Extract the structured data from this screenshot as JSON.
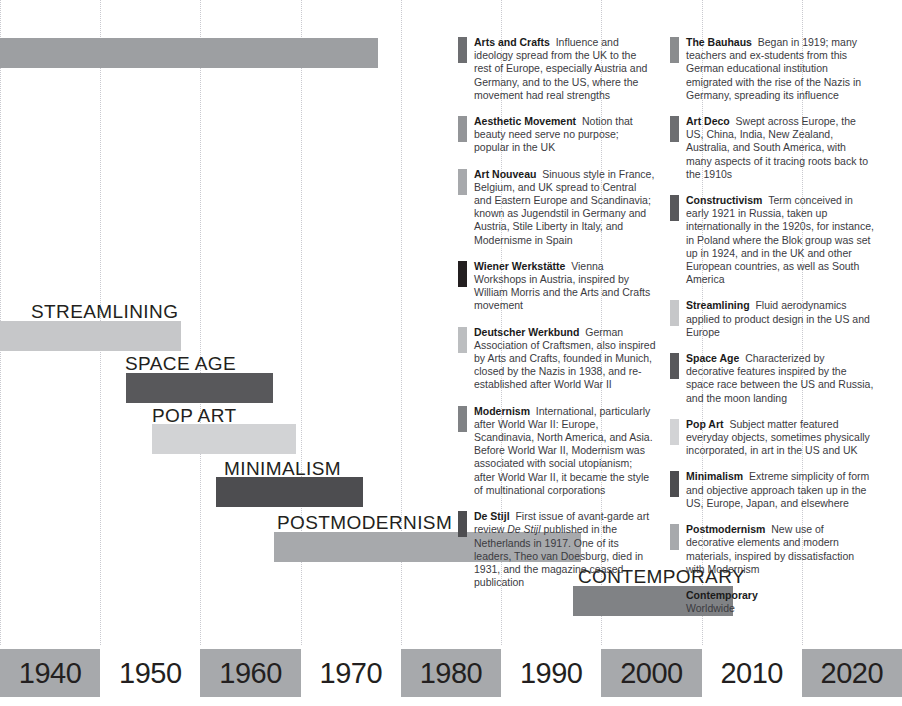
{
  "chart_data": {
    "type": "bar",
    "orientation": "horizontal-timeline",
    "title": "",
    "xlabel": "",
    "ylabel": "",
    "axis": {
      "tick_labels": [
        "1940",
        "1950",
        "1960",
        "1970",
        "1980",
        "1990",
        "2000",
        "2010",
        "2020"
      ],
      "shading": [
        "shaded",
        "plain",
        "shaded",
        "plain",
        "shaded",
        "plain",
        "shaded",
        "plain",
        "shaded"
      ],
      "xlim": [
        1935,
        2025
      ],
      "grid": true
    },
    "bars": [
      {
        "label": "",
        "label_visible": false,
        "start": 1935,
        "end": 1970,
        "color": "#9d9fa2",
        "x": 0,
        "width": 378,
        "top": 38,
        "label_x": 0,
        "label_y": 0
      },
      {
        "label": "STREAMLINING",
        "label_visible": true,
        "start": 1935,
        "end": 1950.5,
        "color": "#c6c7c9",
        "x": 0,
        "width": 181,
        "top": 321,
        "label_x": 31,
        "label_y": 302
      },
      {
        "label": "SPACE AGE",
        "label_visible": true,
        "start": 1954,
        "end": 1969,
        "color": "#58585b",
        "x": 126,
        "width": 147,
        "top": 373,
        "label_x": 125,
        "label_y": 354
      },
      {
        "label": "POP ART",
        "label_visible": true,
        "start": 1957,
        "end": 1971,
        "color": "#d2d3d5",
        "x": 152,
        "width": 144,
        "top": 424,
        "label_x": 152,
        "label_y": 406
      },
      {
        "label": "MINIMALISM",
        "label_visible": true,
        "start": 1961,
        "end": 1976,
        "color": "#4d4d50",
        "x": 216,
        "width": 147,
        "top": 477,
        "label_x": 224,
        "label_y": 459
      },
      {
        "label": "POSTMODERNISM",
        "label_visible": true,
        "start": 1966,
        "end": 1996,
        "color": "#a7a9ac",
        "x": 274,
        "width": 307,
        "top": 532,
        "label_x": 277,
        "label_y": 513
      },
      {
        "label": "CONTEMPORARY",
        "label_visible": true,
        "start": 1996,
        "end": 2012,
        "color": "#808285",
        "x": 573,
        "width": 160,
        "top": 586,
        "label_x": 578,
        "label_y": 567
      }
    ]
  },
  "legend": {
    "columns": [
      {
        "entries": [
          {
            "term": "Arts and Crafts",
            "description": "Influence and ideology spread from the UK to the rest of Europe, especially Austria and Germany, and to the US, where the movement had real strengths",
            "color": "#6d6e71"
          },
          {
            "term": "Aesthetic Movement",
            "description": "Notion that beauty need serve no purpose; popular in the UK",
            "color": "#939598"
          },
          {
            "term": "Art Nouveau",
            "description": "Sinuous style in France, Belgium, and UK spread to Central and Eastern Europe and Scandinavia; known as Jugendstil in Germany and Austria, Stile Liberty in Italy, and Modernisme in Spain",
            "color": "#a7a9ac"
          },
          {
            "term": "Wiener Werkstätte",
            "description": "Vienna Workshops in Austria, inspired by William Morris and the Arts and Crafts movement",
            "color": "#231f20"
          },
          {
            "term": "Deutscher Werkbund",
            "description": "German Association of Craftsmen, also inspired by Arts and Crafts, founded in Munich, closed by the Nazis in 1938, and re-established after World War II",
            "color": "#bcbec0"
          },
          {
            "term": "Modernism",
            "description": "International, particularly after World War II: Europe, Scandinavia, North America, and Asia. Before World War II, Modernism was associated with social utopianism; after World War II, it became the style of multinational corporations",
            "color": "#808285"
          },
          {
            "term": "De Stijl",
            "description_html": "First issue of avant-garde art review <em>De Stijl</em> published in the Netherlands in 1917. One of its leaders, Theo van Doesburg, died in 1931, and the magazine ceased publication",
            "color": "#4d4d50"
          }
        ]
      },
      {
        "entries": [
          {
            "term": "The Bauhaus",
            "description": "Began in 1919; many teachers and ex-students from this German educational institution emigrated with the rise of the Nazis in Germany, spreading its influence",
            "color": "#8a8c8e"
          },
          {
            "term": "Art Deco",
            "description": "Swept across Europe, the US, China, India, New Zealand, Australia, and South America, with many aspects of it tracing roots back to the 1910s",
            "color": "#6d6e71"
          },
          {
            "term": "Constructivism",
            "description": "Term conceived in early 1921 in Russia, taken up internationally in the 1920s, for instance, in Poland where the Blok group was set up in 1924, and in the UK and other European countries, as well as South America",
            "color": "#58585b"
          },
          {
            "term": "Streamlining",
            "description": "Fluid aerodynamics applied to product design in the US and Europe",
            "color": "#c6c7c9"
          },
          {
            "term": "Space Age",
            "description": "Characterized by decorative features inspired by the space race between the US and Russia, and the moon landing",
            "color": "#58585b"
          },
          {
            "term": "Pop Art",
            "description": "Subject matter featured everyday objects, sometimes physically incorporated, in art in the US and UK",
            "color": "#d2d3d5"
          },
          {
            "term": "Minimalism",
            "description": "Extreme simplicity of form and objective approach taken up in the US, Europe, Japan, and elsewhere",
            "color": "#4d4d50"
          },
          {
            "term": "Postmodernism",
            "description": "New use of decorative elements and modern materials, inspired by dissatisfaction with Modernism",
            "color": "#a7a9ac"
          },
          {
            "term": "Contemporary",
            "description": "Worldwide",
            "color": "#808285",
            "break_after_term": true
          }
        ]
      }
    ]
  }
}
